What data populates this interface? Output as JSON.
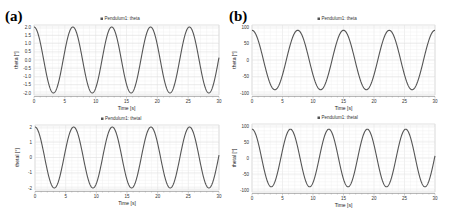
{
  "panels": [
    {
      "label": "(a)"
    },
    {
      "label": "(b)"
    }
  ],
  "chart_data": [
    {
      "type": "line",
      "panel": "(a)",
      "position": "top",
      "legend": "Pendulum1: theta",
      "series_color": "#555555",
      "xlabel": "Time [s]",
      "ylabel": "theta [°]",
      "xlim": [
        0,
        30
      ],
      "ylim": [
        -2.0,
        2.0
      ],
      "xticks": [
        "0",
        "5",
        "10",
        "15",
        "20",
        "25",
        "30"
      ],
      "yticks": [
        "2.0",
        "1.5",
        "1.0",
        "0.5",
        "0.0",
        "-0.5",
        "-1.0",
        "-1.5",
        "-2.0"
      ],
      "grid": true,
      "series": [
        {
          "name": "theta",
          "function": "2*cos(2*pi*t/6.3)",
          "amplitude": 2.0,
          "period": 6.3,
          "phase": 0
        }
      ],
      "box": {
        "x0": 34,
        "x1": 219,
        "ytop": 27,
        "ybot": 93,
        "ymax": 2,
        "ymin": -2
      }
    },
    {
      "type": "line",
      "panel": "(a)",
      "position": "bottom",
      "legend": "Pendulum1: thetaI",
      "series_color": "#555555",
      "xlabel": "Time [s]",
      "ylabel": "thetaI [°]",
      "xlim": [
        0,
        30
      ],
      "ylim": [
        -2,
        2
      ],
      "xticks": [
        "0",
        "5",
        "10",
        "15",
        "20",
        "25",
        "30"
      ],
      "yticks": [
        "2",
        "1",
        "0",
        "-1",
        "-2"
      ],
      "grid": true,
      "series": [
        {
          "name": "thetaI",
          "function": "2*cos(2*pi*t/6.3)",
          "amplitude": 2.0,
          "period": 6.3,
          "phase": 0
        }
      ],
      "box": {
        "x0": 35,
        "x1": 219,
        "ytop": 127,
        "ybot": 188,
        "ymax": 2,
        "ymin": -2
      }
    },
    {
      "type": "line",
      "panel": "(b)",
      "position": "top",
      "legend": "Pendulum1: theta",
      "series_color": "#555555",
      "xlabel": "Time [s]",
      "ylabel": "theta [°]",
      "xlim": [
        0,
        30
      ],
      "ylim": [
        -100,
        100
      ],
      "xticks": [
        "0",
        "5",
        "10",
        "15",
        "20",
        "25",
        "30"
      ],
      "yticks": [
        "100",
        "50",
        "0",
        "-50",
        "-100"
      ],
      "grid": true,
      "series": [
        {
          "name": "theta",
          "function": "90*cos(2*pi*t/7.5)",
          "amplitude": 90,
          "period": 7.5,
          "phase": 0
        }
      ],
      "box": {
        "x0": 252,
        "x1": 435,
        "ytop": 27,
        "ybot": 93,
        "ymax": 100,
        "ymin": -100
      }
    },
    {
      "type": "line",
      "panel": "(b)",
      "position": "bottom",
      "legend": "Pendulum1: thetaI",
      "series_color": "#555555",
      "xlabel": "Time [s]",
      "ylabel": "thetaI [°]",
      "xlim": [
        0,
        30
      ],
      "ylim": [
        -100,
        100
      ],
      "xticks": [
        "0",
        "5",
        "10",
        "15",
        "20",
        "25",
        "30"
      ],
      "yticks": [
        "100",
        "50",
        "0",
        "-50",
        "-100"
      ],
      "grid": true,
      "series": [
        {
          "name": "thetaI",
          "function": "90*cos(2*pi*t/6.3)",
          "amplitude": 90,
          "period": 6.3,
          "phase": 0
        }
      ],
      "box": {
        "x0": 252,
        "x1": 435,
        "ytop": 126,
        "ybot": 190,
        "ymax": 100,
        "ymin": -100
      }
    }
  ]
}
